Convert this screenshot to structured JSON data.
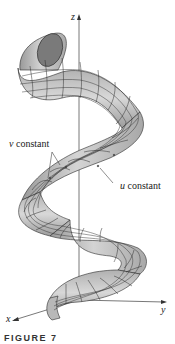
{
  "figure": {
    "axes": {
      "z_label": "z",
      "x_label": "x",
      "y_label": "y"
    },
    "annotations": {
      "v_constant": {
        "var": "v",
        "text": " constant"
      },
      "u_constant": {
        "var": "u",
        "text": " constant"
      }
    },
    "caption": "FIGURE 7",
    "colors": {
      "surface_fill": "#c8c8c8",
      "surface_dark": "#8a8a8a",
      "mesh_line": "#2a2a2a",
      "axis": "#555555",
      "background": "#ffffff"
    }
  }
}
